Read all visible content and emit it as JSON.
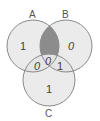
{
  "diagram": {
    "type": "venn",
    "sets": [
      {
        "id": "A",
        "label": "A",
        "cx": 33,
        "cy": 46,
        "r": 26
      },
      {
        "id": "B",
        "label": "B",
        "cx": 66,
        "cy": 46,
        "r": 26
      },
      {
        "id": "C",
        "label": "C",
        "cx": 49,
        "cy": 80,
        "r": 26
      }
    ],
    "regions": {
      "A_only": "1",
      "B_only": "0",
      "C_only": "1",
      "AC_only": "0",
      "ABC": "0",
      "BC_only": "1",
      "AB_only": ""
    },
    "colors": {
      "circle_fill": "#e3e3e3",
      "circle_stroke": "#8a8a8a",
      "shaded_region": "#8c8c8c",
      "text": "#444444"
    },
    "shaded": "A∩B only"
  }
}
